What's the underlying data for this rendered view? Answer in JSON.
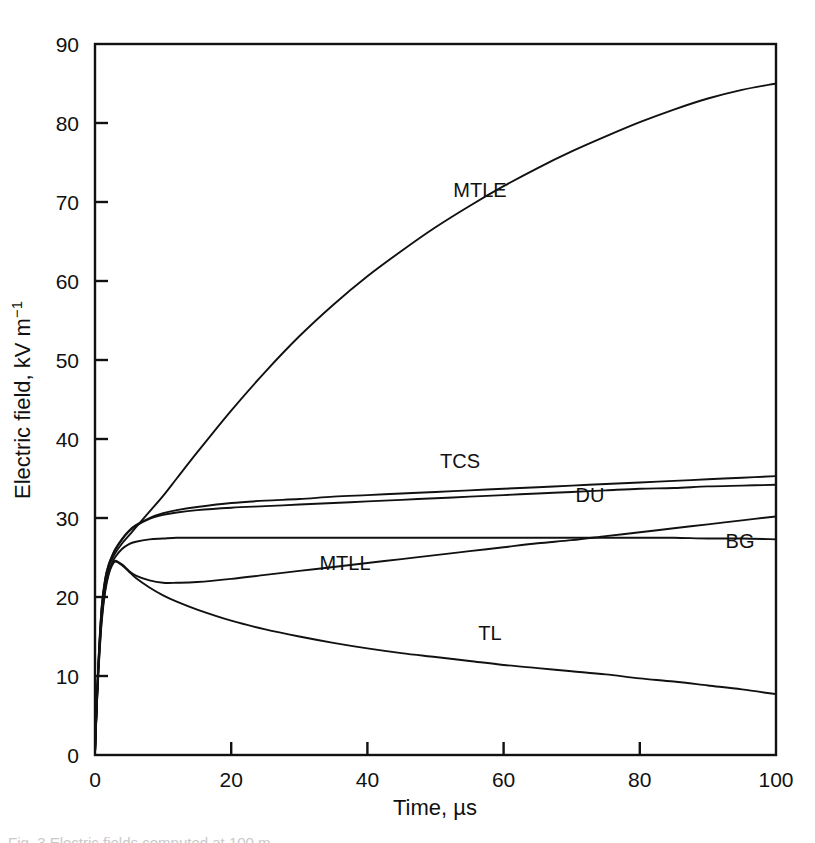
{
  "figure": {
    "background_color": "#ffffff",
    "line_color": "#111111",
    "caption_fragment": "Fig. 3 Electric fields computed at 100 m"
  },
  "axes": {
    "x": {
      "title": "Time, µs",
      "ticks": [
        "0",
        "20",
        "40",
        "60",
        "80",
        "100"
      ],
      "min": 0,
      "max": 100
    },
    "y": {
      "title_main": "Electric field, kV m",
      "title_exponent": "−1",
      "ticks": [
        "0",
        "10",
        "20",
        "30",
        "40",
        "50",
        "60",
        "70",
        "80",
        "90"
      ],
      "min": 0,
      "max": 90
    }
  },
  "series_labels": {
    "mtle": "MTLE",
    "tcs": "TCS",
    "du": "DU",
    "bg": "BG",
    "mtll": "MTLL",
    "tl": "TL"
  },
  "chart_data": {
    "type": "line",
    "title": "",
    "xlabel": "Time, µs",
    "ylabel": "Electric field, kV m−1",
    "xlim": [
      0,
      100
    ],
    "ylim": [
      0,
      90
    ],
    "grid": false,
    "legend": "inline-curve-labels",
    "x": [
      0,
      0.3,
      0.6,
      1,
      1.5,
      2,
      2.5,
      3,
      4,
      5,
      6,
      8,
      10,
      12,
      15,
      20,
      25,
      30,
      35,
      40,
      45,
      50,
      55,
      60,
      65,
      70,
      75,
      80,
      85,
      90,
      95,
      100
    ],
    "series": [
      {
        "name": "MTLE",
        "label": "MTLE",
        "values": [
          0.3,
          7.5,
          13.0,
          18.5,
          22.0,
          23.8,
          24.8,
          25.6,
          26.8,
          27.8,
          28.8,
          30.8,
          32.8,
          35.0,
          38.3,
          43.6,
          48.5,
          53.0,
          57.0,
          60.6,
          63.8,
          66.8,
          69.5,
          72.0,
          74.3,
          76.4,
          78.3,
          80.1,
          81.7,
          83.1,
          84.2,
          85.0
        ]
      },
      {
        "name": "TCS",
        "label": "TCS",
        "values": [
          0.3,
          7.8,
          13.5,
          19.0,
          22.4,
          24.1,
          25.2,
          26.1,
          27.4,
          28.4,
          29.1,
          30.0,
          30.6,
          31.0,
          31.4,
          31.9,
          32.2,
          32.4,
          32.7,
          32.9,
          33.1,
          33.3,
          33.5,
          33.7,
          33.9,
          34.1,
          34.3,
          34.5,
          34.7,
          34.9,
          35.1,
          35.3
        ]
      },
      {
        "name": "DU",
        "label": "DU",
        "values": [
          0.3,
          7.6,
          13.2,
          18.7,
          22.2,
          24.0,
          25.1,
          26.0,
          27.3,
          28.3,
          29.0,
          29.9,
          30.4,
          30.7,
          31.0,
          31.3,
          31.5,
          31.7,
          31.9,
          32.1,
          32.3,
          32.5,
          32.7,
          32.9,
          33.1,
          33.3,
          33.5,
          33.7,
          33.8,
          34.0,
          34.1,
          34.2
        ]
      },
      {
        "name": "BG",
        "label": "BG",
        "values": [
          0.3,
          7.2,
          12.6,
          17.8,
          21.3,
          23.2,
          24.3,
          25.1,
          26.1,
          26.7,
          27.0,
          27.3,
          27.4,
          27.5,
          27.5,
          27.5,
          27.5,
          27.5,
          27.5,
          27.5,
          27.5,
          27.5,
          27.5,
          27.5,
          27.5,
          27.5,
          27.5,
          27.5,
          27.5,
          27.4,
          27.4,
          27.3
        ]
      },
      {
        "name": "MTLL",
        "label": "MTLL",
        "values": [
          0.3,
          7.0,
          12.2,
          17.4,
          21.0,
          23.0,
          24.1,
          24.6,
          24.1,
          23.3,
          22.7,
          22.1,
          21.8,
          21.8,
          21.9,
          22.3,
          22.8,
          23.3,
          23.8,
          24.3,
          24.8,
          25.3,
          25.8,
          26.3,
          26.8,
          27.2,
          27.7,
          28.2,
          28.7,
          29.2,
          29.7,
          30.2
        ]
      },
      {
        "name": "TL",
        "label": "TL",
        "values": [
          0.3,
          6.8,
          11.9,
          17.0,
          20.7,
          22.8,
          24.0,
          24.5,
          24.0,
          23.2,
          22.4,
          21.2,
          20.2,
          19.4,
          18.4,
          17.0,
          15.9,
          15.0,
          14.2,
          13.5,
          12.9,
          12.4,
          11.9,
          11.4,
          11.0,
          10.6,
          10.2,
          9.7,
          9.3,
          8.8,
          8.3,
          7.7
        ]
      }
    ]
  }
}
